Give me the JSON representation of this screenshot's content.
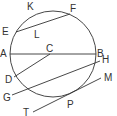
{
  "diagram": {
    "type": "circle-geometry",
    "colors": {
      "stroke": "#333333",
      "background": "#ffffff"
    },
    "circle": {
      "cx": 53,
      "cy": 54,
      "r": 43
    },
    "labels": {
      "K": "K",
      "F": "F",
      "E": "E",
      "L": "L",
      "A": "A",
      "C": "C",
      "B": "B",
      "H": "H",
      "D": "D",
      "G": "G",
      "M": "M",
      "P": "P",
      "T": "T"
    },
    "segments": [
      {
        "name": "chord-EF",
        "from": "E",
        "to": "F"
      },
      {
        "name": "diameter-AB",
        "from": "A",
        "to": "B",
        "through": "C"
      },
      {
        "name": "radius-CD",
        "from": "C",
        "to": "D"
      },
      {
        "name": "secant-GH",
        "from": "G",
        "to": "H"
      },
      {
        "name": "tangent-TM",
        "from": "T",
        "to": "M",
        "touches_at": "P"
      }
    ]
  }
}
